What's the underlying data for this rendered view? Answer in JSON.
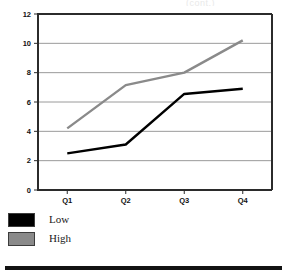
{
  "page": {
    "title_remnant": "(cont.)",
    "bottom_rule": "horizontal-rule"
  },
  "chart_data": {
    "type": "line",
    "title": "",
    "xlabel": "",
    "ylabel": "",
    "categories": [
      "Q1",
      "Q2",
      "Q3",
      "Q4"
    ],
    "series": [
      {
        "name": "Low",
        "color": "#000000",
        "values": [
          2.5,
          3.1,
          6.55,
          6.9
        ]
      },
      {
        "name": "High",
        "color": "#8a8a8a",
        "values": [
          4.2,
          7.15,
          8.0,
          10.2
        ]
      }
    ],
    "ylim": [
      0,
      12
    ],
    "yticks": [
      0,
      2,
      4,
      6,
      8,
      10,
      12
    ],
    "ytick_labels": [
      "0",
      "2",
      "4",
      "6",
      "8",
      "10",
      "12"
    ],
    "xtick_labels": [
      "Q1",
      "Q2",
      "Q3",
      "Q4"
    ],
    "grid": true,
    "grid_color": "#9a9a9a",
    "axis_color": "#2b2b2b",
    "legend_position": "below-left",
    "legend": [
      {
        "label": "Low",
        "color": "#000000"
      },
      {
        "label": "High",
        "color": "#8a8a8a"
      }
    ]
  }
}
